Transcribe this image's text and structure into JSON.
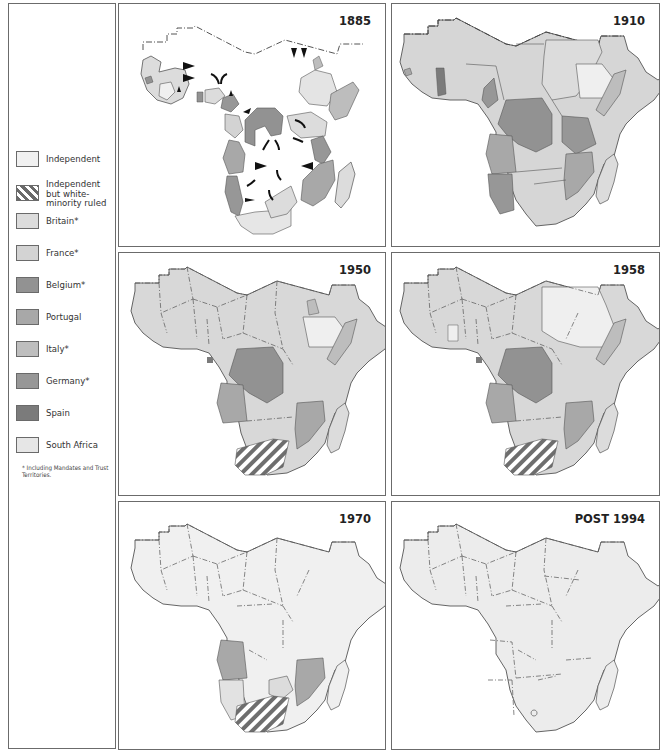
{
  "legend": {
    "items": [
      {
        "key": "independent",
        "label": "Independent",
        "color": "#f0f0f0"
      },
      {
        "key": "white_minority",
        "label": "Independent\nbut white-\nminority ruled",
        "color": "hatch"
      },
      {
        "key": "britain",
        "label": "Britain*",
        "color": "#dcdcdc"
      },
      {
        "key": "france",
        "label": "France*",
        "color": "#d2d2d2"
      },
      {
        "key": "belgium",
        "label": "Belgium*",
        "color": "#8f8f8f"
      },
      {
        "key": "portugal",
        "label": "Portugal",
        "color": "#a5a5a5"
      },
      {
        "key": "italy",
        "label": "Italy*",
        "color": "#bdbdbd"
      },
      {
        "key": "germany",
        "label": "Germany*",
        "color": "#959595"
      },
      {
        "key": "spain",
        "label": "Spain",
        "color": "#7a7a7a"
      },
      {
        "key": "south_africa",
        "label": "South Africa",
        "color": "#e4e4e4"
      }
    ],
    "footnote": "* Including Mandates and Trust Territories."
  },
  "panels": [
    {
      "id": "p1885",
      "title": "1885"
    },
    {
      "id": "p1910",
      "title": "1910"
    },
    {
      "id": "p1950",
      "title": "1950"
    },
    {
      "id": "p1958",
      "title": "1958"
    },
    {
      "id": "p1970",
      "title": "1970"
    },
    {
      "id": "p1994",
      "title": "POST 1994"
    }
  ],
  "colors": {
    "border": "#6b6b6b",
    "coast": "#555555",
    "light": "#e2e2e2",
    "lighter": "#efefef",
    "medium": "#a8a8a8",
    "dark": "#8c8c8c"
  }
}
